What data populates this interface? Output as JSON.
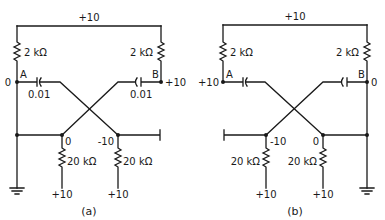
{
  "figures": [
    {
      "id": "a",
      "caption": "(a)",
      "supply_top": "+10",
      "resistor_left": "2 kΩ",
      "resistor_right": "2 kΩ",
      "node_a_label": "A",
      "node_b_label": "B",
      "node_a_voltage": "0",
      "node_b_voltage": "+10",
      "cap_left": "0.01",
      "cap_right": "0.01",
      "bottom_left_node_voltage": "0",
      "bottom_right_node_voltage": "-10",
      "bottom_resistor_left": "20 kΩ",
      "bottom_resistor_right": "20 kΩ",
      "bottom_supply_left": "+10",
      "bottom_supply_right": "+10"
    },
    {
      "id": "b",
      "caption": "(b)",
      "supply_top": "+10",
      "resistor_left": "2 kΩ",
      "resistor_right": "2 kΩ",
      "node_a_label": "A",
      "node_b_label": "B",
      "node_a_voltage": "+10",
      "node_b_voltage": "0",
      "bottom_left_node_voltage": "-10",
      "bottom_right_node_voltage": "0",
      "bottom_resistor_left": "20 kΩ",
      "bottom_resistor_right": "20 kΩ",
      "bottom_supply_left": "+10",
      "bottom_supply_right": "+10"
    }
  ]
}
